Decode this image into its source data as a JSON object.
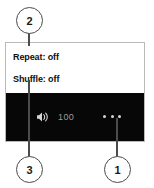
{
  "annotation": {
    "callouts": [
      {
        "number": "1",
        "target": "more-options-button"
      },
      {
        "number": "2",
        "target": "settings-panel"
      },
      {
        "number": "3",
        "target": "shuffle-setting"
      }
    ]
  },
  "player": {
    "settings": [
      {
        "label": "Repeat: off",
        "name": "repeat",
        "state": "off"
      },
      {
        "label": "Shuffle: off",
        "name": "shuffle",
        "state": "off"
      }
    ],
    "control_bar": {
      "volume_icon": "speaker-volume-icon",
      "volume_value": "100",
      "more_icon": "ellipsis-icon",
      "background_color": "#070707",
      "text_color": "#9b9b9b"
    },
    "panel_border_color": "#b9b9b9",
    "panel_background": "#ffffff"
  }
}
